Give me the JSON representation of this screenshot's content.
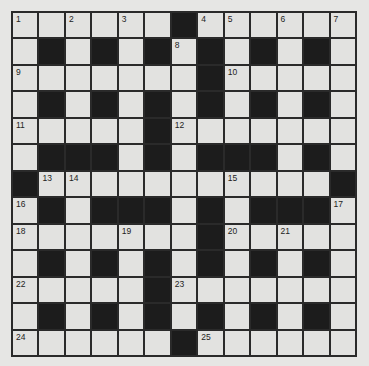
{
  "puzzle": {
    "rows": 13,
    "cols": 13,
    "colors": {
      "background": "#e6e6e4",
      "cell": "#e2e2e0",
      "block": "#1c1c1c",
      "gridline": "#2a2a2a",
      "number": "#222222"
    },
    "layout": [
      "......#......",
      ".#.#.#.#.#.#.",
      ".......#.....",
      ".#.#.#.#.#.#.",
      ".....#.......",
      ".###.#.###.#.",
      "#...........#",
      ".#.###.#.###.",
      ".......#.....",
      ".#.#.#.#.#.#.",
      ".....#.......",
      ".#.#.#.#.#.#.",
      "......#......"
    ],
    "numbers": [
      {
        "r": 0,
        "c": 0,
        "n": "1"
      },
      {
        "r": 0,
        "c": 2,
        "n": "2"
      },
      {
        "r": 0,
        "c": 4,
        "n": "3"
      },
      {
        "r": 0,
        "c": 7,
        "n": "4"
      },
      {
        "r": 0,
        "c": 8,
        "n": "5"
      },
      {
        "r": 0,
        "c": 10,
        "n": "6"
      },
      {
        "r": 0,
        "c": 12,
        "n": "7"
      },
      {
        "r": 1,
        "c": 6,
        "n": "8"
      },
      {
        "r": 2,
        "c": 0,
        "n": "9"
      },
      {
        "r": 2,
        "c": 8,
        "n": "10"
      },
      {
        "r": 4,
        "c": 0,
        "n": "11"
      },
      {
        "r": 4,
        "c": 6,
        "n": "12"
      },
      {
        "r": 6,
        "c": 1,
        "n": "13"
      },
      {
        "r": 6,
        "c": 2,
        "n": "14"
      },
      {
        "r": 6,
        "c": 8,
        "n": "15"
      },
      {
        "r": 7,
        "c": 0,
        "n": "16"
      },
      {
        "r": 7,
        "c": 12,
        "n": "17"
      },
      {
        "r": 8,
        "c": 0,
        "n": "18"
      },
      {
        "r": 8,
        "c": 4,
        "n": "19"
      },
      {
        "r": 8,
        "c": 8,
        "n": "20"
      },
      {
        "r": 8,
        "c": 10,
        "n": "21"
      },
      {
        "r": 10,
        "c": 0,
        "n": "22"
      },
      {
        "r": 10,
        "c": 6,
        "n": "23"
      },
      {
        "r": 12,
        "c": 0,
        "n": "24"
      },
      {
        "r": 12,
        "c": 7,
        "n": "25"
      }
    ]
  }
}
